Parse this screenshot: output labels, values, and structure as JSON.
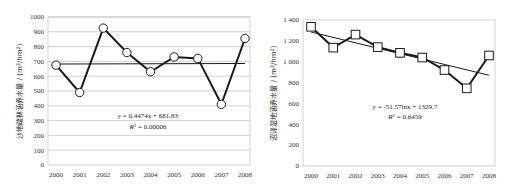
{
  "chart_data": [
    {
      "type": "line",
      "title": "",
      "xlabel": "",
      "ylabel": "沙地疏林涵养水量 / (m³/hm²)",
      "categories": [
        "2000",
        "2001",
        "2002",
        "2003",
        "2004",
        "2005",
        "2006",
        "2007",
        "2008"
      ],
      "series": [
        {
          "name": "沙地疏林涵养水量",
          "marker": "circle",
          "values": [
            675,
            490,
            925,
            760,
            630,
            730,
            720,
            410,
            855
          ]
        },
        {
          "name": "线性趋势",
          "type": "trendline",
          "values": [
            682.3,
            682.7,
            683.2,
            683.6,
            684.1,
            684.5,
            685.0,
            685.4,
            685.9
          ]
        }
      ],
      "yticks": [
        0,
        100,
        200,
        300,
        400,
        500,
        600,
        700,
        800,
        900,
        1000
      ],
      "ytick_labels": [
        "0",
        "100",
        "200",
        "300",
        "400",
        "500",
        "600",
        "700",
        "800",
        "900",
        "1000"
      ],
      "ylim": [
        0,
        1000
      ],
      "grid": true,
      "annotations": {
        "equation": "y = 0.4474x + 681.83",
        "r2_label": "R",
        "r2_value": "= 0.00006"
      }
    },
    {
      "type": "line",
      "title": "",
      "xlabel": "",
      "ylabel": "沼泽湿地涵养水量 / (m³/hm²)",
      "categories": [
        "2000",
        "2001",
        "2002",
        "2003",
        "2004",
        "2005",
        "2006",
        "2007",
        "2008"
      ],
      "series": [
        {
          "name": "沼泽湿地涵养水量",
          "marker": "square",
          "values": [
            1335,
            1135,
            1260,
            1140,
            1085,
            1040,
            920,
            745,
            1060
          ]
        },
        {
          "name": "对数趋势",
          "type": "trendline",
          "values": [
            1329.7,
            1294.0,
            1273.0,
            1258.2,
            1246.7,
            1237.3,
            1229.3,
            1222.5,
            1216.4
          ]
        }
      ],
      "yticks": [
        0,
        200,
        400,
        600,
        800,
        1000,
        1200,
        1400
      ],
      "ytick_labels": [
        "0",
        "200",
        "400",
        "600",
        "800",
        "1 000",
        "1 200",
        "1 400"
      ],
      "ylim": [
        0,
        1400
      ],
      "grid": false,
      "annotations": {
        "equation": "y = -51.57lnx + 1329.7",
        "r2_label": "R",
        "r2_value": "= 0.6459"
      }
    }
  ],
  "left": {
    "ylabel": "沙地疏林涵养水量 / (m³/hm²)",
    "ylabel_main": "沙地疏林涵养水量 / (m",
    "ylabel_sup": "3",
    "ylabel_mid": "/hm",
    "ylabel_sup2": "2",
    "ylabel_end": ")",
    "yticks": [
      "0",
      "100",
      "200",
      "300",
      "400",
      "500",
      "600",
      "700",
      "800",
      "900",
      "1000"
    ],
    "xticks": [
      "2000",
      "2001",
      "2002",
      "2003",
      "2004",
      "2005",
      "2006",
      "2007",
      "2008"
    ],
    "eq_y": "y",
    "eq_rest": " = 0.4474x + 681.83",
    "r2_R": "R",
    "r2_sup": "2",
    "r2_rest": " = 0.00006"
  },
  "right": {
    "ylabel": "沼泽湿地涵养水量 / (m³/hm²)",
    "ylabel_main": "沼泽湿地涵养水量 / (m",
    "ylabel_sup": "3",
    "ylabel_mid": "/hm",
    "ylabel_sup2": "2",
    "ylabel_end": ")",
    "yticks": [
      "0",
      "200",
      "400",
      "600",
      "800",
      "1 000",
      "1 200",
      "1 400"
    ],
    "xticks": [
      "2000",
      "2001",
      "2002",
      "2003",
      "2004",
      "2005",
      "2006",
      "2007",
      "2008"
    ],
    "eq_y": "y",
    "eq_rest": " = -51.57lnx + 1329.7",
    "r2_R": "R",
    "r2_sup": "2",
    "r2_rest": " = 0.6459"
  },
  "colors": {
    "line": "#1a1a1a",
    "grid": "#bdbdbd",
    "frame": "#c8c8c8",
    "marker_fill": "#ffffff"
  }
}
